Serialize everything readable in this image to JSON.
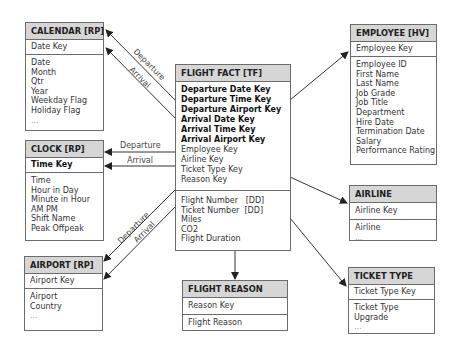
{
  "entities": {
    "calendar": {
      "title": "CALENDAR [RP]",
      "keys": [
        {
          "text": "Date Key",
          "bold": false
        }
      ],
      "attributes": [
        "Date",
        "Month",
        "Qtr",
        "Year",
        "Weekday Flag",
        "Holiday Flag",
        "..."
      ]
    },
    "clock": {
      "title": "CLOCK [RP]",
      "keys": [
        {
          "text": "Time Key",
          "bold": true
        }
      ],
      "attributes": [
        "Time",
        "Hour in Day",
        "Minute in Hour",
        "AM PM",
        "Shift Name",
        "Peak Offpeak"
      ]
    },
    "airport": {
      "title": "AIRPORT [RP]",
      "keys": [
        {
          "text": "Airport Key",
          "bold": false
        }
      ],
      "attributes": [
        "Airport",
        "Country",
        "..."
      ]
    },
    "flight_fact": {
      "title": "FLIGHT FACT [TF]",
      "keys": [
        {
          "text": "Departure Date Key",
          "bold": true
        },
        {
          "text": "Departure Time Key",
          "bold": true
        },
        {
          "text": "Departure Airport Key",
          "bold": true
        },
        {
          "text": "Arrival Date Key",
          "bold": true
        },
        {
          "text": "Arrival Time Key",
          "bold": true
        },
        {
          "text": "Arrival Airport Key",
          "bold": true
        },
        {
          "text": "Employee Key",
          "bold": false
        },
        {
          "text": "Airline Key",
          "bold": false
        },
        {
          "text": "Ticket Type Key",
          "bold": false
        },
        {
          "text": "Reason Key",
          "bold": false
        }
      ],
      "attributes": [
        "Flight Number   [DD]",
        "Ticket Number  [DD]",
        "Miles",
        "CO2",
        "Flight Duration"
      ]
    },
    "flight_reason": {
      "title": "FLIGHT REASON",
      "keys": [
        {
          "text": "Reason Key",
          "bold": false
        }
      ],
      "attributes": [
        "Flight Reason"
      ]
    },
    "employee": {
      "title": "EMPLOYEE [HV]",
      "keys": [
        {
          "text": "Employee Key",
          "bold": false
        }
      ],
      "attributes": [
        "Employee ID",
        "First Name",
        "Last Name",
        "Job Grade",
        "Job Title",
        "Department",
        "Hire Date",
        "Termination Date",
        "Salary",
        "Performance Rating"
      ]
    },
    "airline": {
      "title": "AIRLINE",
      "keys": [
        {
          "text": "Airline Key",
          "bold": false
        }
      ],
      "attributes": [
        "Airline",
        "..."
      ]
    },
    "ticket_type": {
      "title": "TICKET TYPE",
      "keys": [
        {
          "text": "Ticket Type Key",
          "bold": false
        }
      ],
      "attributes": [
        "Ticket Type",
        "Upgrade",
        "..."
      ]
    }
  },
  "relationships": {
    "calendar_departure": "Departure",
    "calendar_arrival": "Arrival",
    "clock_departure": "Departure",
    "clock_arrival": "Arrival",
    "airport_departure": "Departure",
    "airport_arrival": "Arrival"
  },
  "colors": {
    "header_fill": "#d6d6d6",
    "border": "#6b6b6b",
    "arrow": "#222222"
  }
}
